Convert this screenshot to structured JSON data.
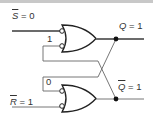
{
  "diagram": {
    "type": "SR latch (NAND, drawn as OR with inverted inputs)",
    "labels": {
      "s_bar": {
        "var": "S",
        "eq": " = 0"
      },
      "r_bar": {
        "var": "R",
        "eq": " = 1"
      },
      "q": {
        "var": "Q",
        "eq": " = 1"
      },
      "q_bar": {
        "var": "Q",
        "eq": " = 1"
      },
      "top_feedback_value": "1",
      "bottom_feedback_value": "0"
    },
    "colors": {
      "wire": "#6b6b6b",
      "gate": "#222222",
      "text": "#333333",
      "border": "#bdbdbd"
    }
  }
}
